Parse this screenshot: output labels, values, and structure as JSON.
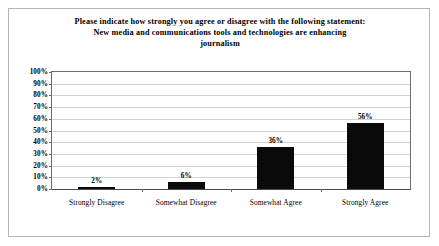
{
  "chart_data": {
    "type": "bar",
    "title": "Please indicate how strongly you agree or disagree with the following statement: New media and communications tools and technologies are enhancing journalism",
    "title_lines": [
      "Please indicate how strongly you agree or disagree with the following statement:",
      "New media and communications tools and technologies are enhancing",
      "journalism"
    ],
    "categories": [
      "Strongly Disagree",
      "Somewhat Disagree",
      "Somewhat Agree",
      "Strongly Agree"
    ],
    "values": [
      2,
      6,
      36,
      56
    ],
    "value_labels": [
      "2%",
      "6%",
      "36%",
      "56%"
    ],
    "xlabel": "",
    "ylabel": "",
    "ylim": [
      0,
      100
    ],
    "ytick_values": [
      0,
      10,
      20,
      30,
      40,
      50,
      60,
      70,
      80,
      90,
      100
    ],
    "ytick_labels": [
      "0%",
      "10%",
      "20%",
      "30%",
      "40%",
      "50%",
      "60%",
      "70%",
      "80%",
      "90%",
      "100%"
    ],
    "grid": "horizontal",
    "legend": "none",
    "bar_color": "#0a0a0a",
    "gridline_color": "#d2d2d2",
    "axis_color": "#6e6e6e",
    "background_color": "#ffffff",
    "border_color": "#b5b5b5"
  }
}
